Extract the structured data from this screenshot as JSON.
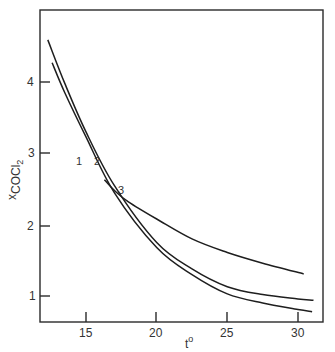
{
  "chart_data": {
    "type": "line",
    "title": "",
    "xlabel": "t°",
    "ylabel": "x_COCl2",
    "xlim": [
      12,
      32
    ],
    "ylim": [
      0.65,
      5.0
    ],
    "grid": false,
    "legend": "inline curve labels",
    "x_ticks": [
      15,
      20,
      25,
      30
    ],
    "y_ticks": [
      1,
      2,
      3,
      4
    ],
    "series": [
      {
        "name": "1",
        "x": [
          12.6,
          13.5,
          15,
          17,
          20,
          22.5,
          25,
          27.5,
          30,
          31.0
        ],
        "values": [
          4.27,
          3.85,
          3.23,
          2.45,
          1.68,
          1.3,
          1.03,
          0.9,
          0.81,
          0.78
        ]
      },
      {
        "name": "2",
        "x": [
          12.3,
          13.5,
          15,
          17,
          20,
          22.5,
          25,
          27.5,
          30,
          31.1
        ],
        "values": [
          4.59,
          3.98,
          3.3,
          2.55,
          1.75,
          1.38,
          1.13,
          1.02,
          0.96,
          0.94
        ]
      },
      {
        "name": "3",
        "x": [
          16.3,
          17,
          18,
          20,
          22.5,
          25,
          27.5,
          30.4
        ],
        "values": [
          2.63,
          2.48,
          2.32,
          2.08,
          1.8,
          1.61,
          1.46,
          1.31
        ]
      }
    ]
  },
  "labels": {
    "x_title": "t",
    "x_title_sup": "o",
    "y_title_main": "x",
    "y_title_sub": "COCl",
    "y_title_subsub": "2",
    "ticks_x": [
      "15",
      "20",
      "25",
      "30"
    ],
    "ticks_y": [
      "4",
      "3",
      "2",
      "1"
    ],
    "curve_labels": [
      "1",
      "2",
      "3"
    ]
  }
}
